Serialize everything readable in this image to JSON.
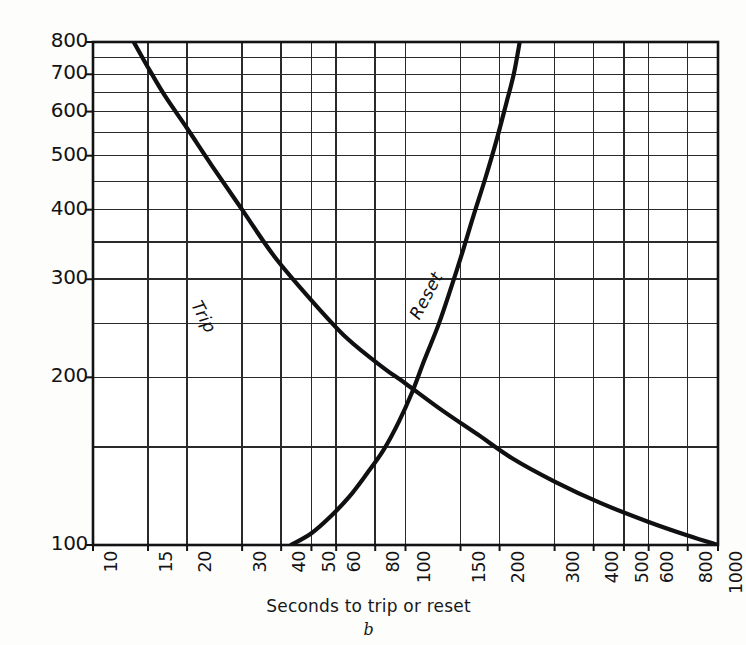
{
  "chart_data": {
    "type": "line",
    "title": "",
    "caption": "b",
    "xlabel": "Seconds to trip or reset",
    "ylabel": "Per cent rated heater current",
    "xscale": "log",
    "yscale": "log",
    "xlim": [
      10,
      1000
    ],
    "ylim": [
      100,
      800
    ],
    "grid": true,
    "legend_position": "inline-curve-labels",
    "xticks": [
      10,
      15,
      20,
      30,
      40,
      50,
      60,
      80,
      100,
      150,
      200,
      300,
      400,
      500,
      600,
      800,
      1000
    ],
    "xtick_labels": [
      "10",
      "15",
      "20",
      "30",
      "40",
      "50",
      "60",
      "80",
      "100",
      "150",
      "200",
      "300",
      "400",
      "500",
      "600",
      "800",
      "1000"
    ],
    "yticks": [
      100,
      200,
      300,
      400,
      500,
      600,
      700,
      800
    ],
    "ytick_labels": [
      "100",
      "200",
      "300",
      "400",
      "500",
      "600",
      "700",
      "800"
    ],
    "y_minor_gridlines": [
      150,
      250,
      350,
      450,
      550,
      650,
      750
    ],
    "series": [
      {
        "name": "Trip",
        "label": "Trip",
        "points": [
          [
            13.5,
            800
          ],
          [
            15,
            720
          ],
          [
            17,
            640
          ],
          [
            20,
            560
          ],
          [
            24,
            480
          ],
          [
            30,
            400
          ],
          [
            38,
            330
          ],
          [
            50,
            275
          ],
          [
            65,
            235
          ],
          [
            85,
            208
          ],
          [
            100,
            195
          ],
          [
            130,
            175
          ],
          [
            170,
            158
          ],
          [
            220,
            143
          ],
          [
            300,
            130
          ],
          [
            420,
            119
          ],
          [
            600,
            110
          ],
          [
            800,
            104
          ],
          [
            1000,
            100
          ]
        ]
      },
      {
        "name": "Reset",
        "label": "Reset",
        "points": [
          [
            43,
            100
          ],
          [
            50,
            105
          ],
          [
            58,
            113
          ],
          [
            66,
            122
          ],
          [
            75,
            134
          ],
          [
            85,
            148
          ],
          [
            95,
            166
          ],
          [
            105,
            188
          ],
          [
            115,
            215
          ],
          [
            128,
            250
          ],
          [
            140,
            290
          ],
          [
            152,
            335
          ],
          [
            165,
            390
          ],
          [
            180,
            455
          ],
          [
            195,
            530
          ],
          [
            210,
            620
          ],
          [
            222,
            700
          ],
          [
            232,
            800
          ]
        ]
      }
    ],
    "annotations": [
      {
        "text": "Trip",
        "near_x": 33,
        "near_y": 380,
        "rotation_deg": 62
      },
      {
        "text": "Reset",
        "near_x": 140,
        "near_y": 300,
        "rotation_deg": -62
      }
    ]
  },
  "axes": {
    "y_title": "Per cent rated heater current",
    "x_title": "Seconds to trip or reset"
  },
  "figure": {
    "caption": "b"
  },
  "colors": {
    "ink": "#131315",
    "grid": "#2a2a2c",
    "paper": "#fdfdfb",
    "curve": "#101012"
  }
}
